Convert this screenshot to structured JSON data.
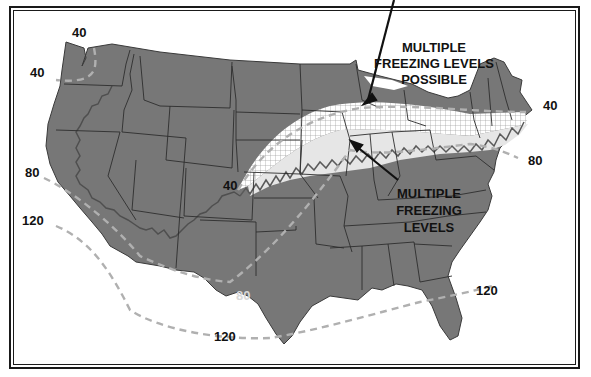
{
  "map": {
    "subject": "Contiguous United States freezing level regions",
    "colors": {
      "land": "#777777",
      "border": "#2e2e2e",
      "multiple_levels_band": "#e6e6e6",
      "possible_band_grid": "#9a9a9a",
      "contour_dash": "#b0b0b0",
      "mountain_boundary": "#555555",
      "text": "#111111",
      "text_light": "#d8d8d8"
    },
    "annotations": {
      "possible": [
        "MULTIPLE",
        "FREEZING LEVELS",
        "POSSIBLE"
      ],
      "multiple": [
        "MULTIPLE",
        "FREEZING",
        "LEVELS"
      ]
    },
    "contour_labels": [
      {
        "id": "nw-top",
        "value": "40"
      },
      {
        "id": "nw-coast",
        "value": "40"
      },
      {
        "id": "colorado",
        "value": "40"
      },
      {
        "id": "northeast",
        "value": "40"
      },
      {
        "id": "west-coast",
        "value": "80"
      },
      {
        "id": "texas",
        "value": "80"
      },
      {
        "id": "east-coast",
        "value": "80"
      },
      {
        "id": "sw-coast",
        "value": "120"
      },
      {
        "id": "gulf",
        "value": "120"
      },
      {
        "id": "atlantic",
        "value": "120"
      }
    ]
  }
}
